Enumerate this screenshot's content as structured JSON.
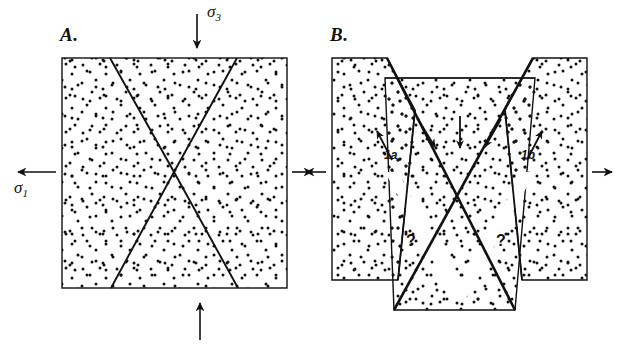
{
  "figure": {
    "type": "geologic-cross-section-diagram",
    "background_color": "#ffffff",
    "line_color": "#111111",
    "stipple_color": "#111111"
  },
  "panels": [
    {
      "id": "A",
      "label": "A.",
      "caption_state": "undeformed block with conjugate fault traces",
      "stress_labels": [
        {
          "name": "sigma3",
          "text": "σ",
          "subscript": "3",
          "arrow": "down",
          "position": "top-center"
        },
        {
          "name": "sigma1",
          "text": "σ",
          "subscript": "1",
          "arrow": "left",
          "position": "left-middle"
        }
      ],
      "arrows": [
        {
          "name": "sigma3-arrow",
          "direction": "down",
          "location": "top-center"
        },
        {
          "name": "sigma1-arrow-left",
          "direction": "left",
          "location": "left-middle"
        },
        {
          "name": "sigma1-arrow-right",
          "direction": "right",
          "location": "right-middle"
        },
        {
          "name": "bottom-arrow",
          "direction": "up",
          "location": "bottom-center"
        }
      ]
    },
    {
      "id": "B",
      "label": "B.",
      "caption_state": "graben dropped, side blocks translated outward, gaps opened along lower fault traces",
      "stress_labels": [],
      "block_labels": [
        {
          "name": "block-label-1a",
          "text": "1a",
          "side": "left"
        },
        {
          "name": "block-label-1b",
          "text": "1b",
          "side": "right"
        }
      ],
      "question_marks": [
        {
          "name": "question-mark-left",
          "text": "?"
        },
        {
          "name": "question-mark-right",
          "text": "?"
        }
      ],
      "arrows": [
        {
          "name": "slip-arrow-1a",
          "direction": "up-left",
          "location": "left-block-interior"
        },
        {
          "name": "slip-arrow-1b",
          "direction": "up-right",
          "location": "right-block-interior"
        },
        {
          "name": "graben-arrow-left",
          "direction": "down-right",
          "location": "graben-upper-left"
        },
        {
          "name": "graben-arrow-center",
          "direction": "down",
          "location": "graben-center"
        },
        {
          "name": "graben-arrow-right",
          "direction": "down-left",
          "location": "graben-upper-right"
        },
        {
          "name": "extension-arrow-left",
          "direction": "left",
          "location": "left-middle"
        },
        {
          "name": "extension-arrow-right",
          "direction": "right",
          "location": "right-middle"
        }
      ]
    }
  ]
}
